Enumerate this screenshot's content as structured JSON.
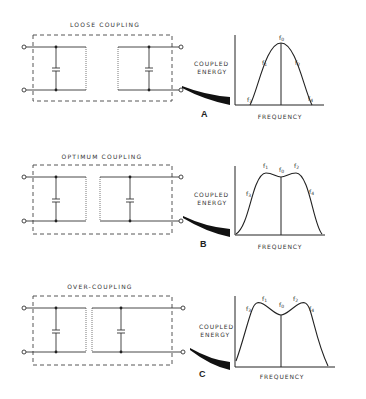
{
  "figure": {
    "panels": [
      {
        "id": "A",
        "title": "LOOSE COUPLING",
        "letter": "A",
        "y_label_line1": "COUPLED",
        "y_label_line2": "ENERGY",
        "x_label": "FREQUENCY",
        "freq_labels": [
          "f0",
          "f1",
          "f2",
          "f3",
          "f4"
        ]
      },
      {
        "id": "B",
        "title": "OPTIMUM COUPLING",
        "letter": "B",
        "y_label_line1": "COUPLED",
        "y_label_line2": "ENERGY",
        "x_label": "FREQUENCY",
        "freq_labels": [
          "f0",
          "f1",
          "f2",
          "f3",
          "f4"
        ]
      },
      {
        "id": "C",
        "title": "OVER-COUPLING",
        "letter": "C",
        "y_label_line1": "COUPLED",
        "y_label_line2": "ENERGY",
        "x_label": "FREQUENCY",
        "freq_labels": [
          "f0",
          "f1",
          "f2",
          "f3",
          "f4"
        ]
      }
    ]
  },
  "colors": {
    "ink": "#222222",
    "background": "#ffffff"
  }
}
